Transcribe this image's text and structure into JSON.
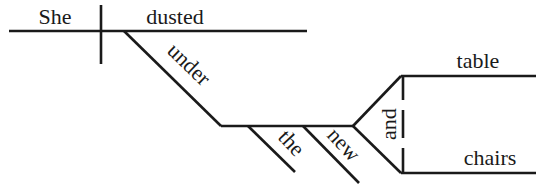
{
  "diagram": {
    "type": "sentence-diagram",
    "sentence": "She dusted under the new table and chairs",
    "words": {
      "subject": "She",
      "verb": "dusted",
      "preposition": "under",
      "article": "the",
      "adjective": "new",
      "conjunction": "and",
      "object1": "table",
      "object2": "chairs"
    },
    "line_color": "#1a1a1a"
  }
}
